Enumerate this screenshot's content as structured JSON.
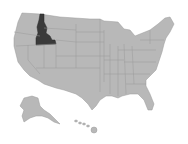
{
  "map": {
    "title": "United States",
    "highlighted_state": "Idaho",
    "colors": {
      "base": "#b8b8b8",
      "border": "#9a9a9a",
      "highlight": "#3a3a3a",
      "background": "#ffffff"
    },
    "regions": [
      "Contiguous United States",
      "Alaska",
      "Hawaii"
    ]
  }
}
